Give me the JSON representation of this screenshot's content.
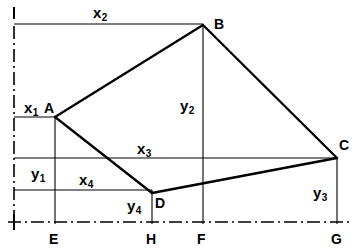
{
  "figure": {
    "type": "line-diagram",
    "width": 355,
    "height": 252,
    "stroke_color": "#000000",
    "background_color": "#ffffff"
  },
  "points": [
    {
      "id": "A",
      "label": "A",
      "x": 55,
      "y": 117,
      "label_x": 44,
      "label_y": 101
    },
    {
      "id": "B",
      "label": "B",
      "x": 203,
      "y": 25,
      "label_x": 214,
      "label_y": 17
    },
    {
      "id": "C",
      "label": "C",
      "x": 337,
      "y": 158,
      "label_x": 339,
      "label_y": 138
    },
    {
      "id": "D",
      "label": "D",
      "x": 152,
      "y": 193,
      "label_x": 155,
      "label_y": 196
    },
    {
      "id": "E",
      "label": "E",
      "x": 55,
      "y": 222,
      "label_x": 49,
      "label_y": 232
    },
    {
      "id": "H",
      "label": "H",
      "x": 152,
      "y": 222,
      "label_x": 146,
      "label_y": 232
    },
    {
      "id": "F",
      "label": "F",
      "x": 203,
      "y": 222,
      "label_x": 197,
      "label_y": 232
    },
    {
      "id": "G",
      "label": "G",
      "x": 337,
      "y": 222,
      "label_x": 331,
      "label_y": 232
    }
  ],
  "dimension_labels": [
    {
      "id": "x1",
      "base": "x",
      "sub": "1",
      "x": 24,
      "y": 100
    },
    {
      "id": "x2",
      "base": "x",
      "sub": "2",
      "x": 93,
      "y": 5
    },
    {
      "id": "x3",
      "base": "x",
      "sub": "3",
      "x": 137,
      "y": 141
    },
    {
      "id": "x4",
      "base": "x",
      "sub": "4",
      "x": 79,
      "y": 172
    },
    {
      "id": "y1",
      "base": "y",
      "sub": "1",
      "x": 31,
      "y": 166
    },
    {
      "id": "y2",
      "base": "y",
      "sub": "2",
      "x": 180,
      "y": 98
    },
    {
      "id": "y3",
      "base": "y",
      "sub": "3",
      "x": 313,
      "y": 185
    },
    {
      "id": "y4",
      "base": "y",
      "sub": "4",
      "x": 127,
      "y": 198
    }
  ],
  "shape": {
    "quadrilateral": "ABCD",
    "vertices": [
      "A",
      "B",
      "C",
      "D"
    ]
  },
  "axes": {
    "vertical_datum_x": 14,
    "horizontal_datum_y": 222
  }
}
